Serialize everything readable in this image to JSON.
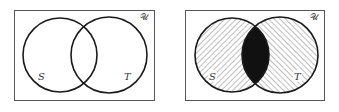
{
  "diagrams": [
    {
      "name": "unshaded",
      "universal_label": "𝒰",
      "set_a_label": "S",
      "set_b_label": "T",
      "shading": "none"
    },
    {
      "name": "shaded",
      "universal_label": "𝒰",
      "set_a_label": "S",
      "set_b_label": "T",
      "shading": "S and T hatched (S: \\ direction, T: / direction), intersection S∩T solid black"
    }
  ],
  "colors": {
    "border": "#555555",
    "circle_stroke": "#1a1a1a",
    "hatch": "#8a8a8a",
    "intersection_fill": "#111111",
    "background": "#ffffff"
  }
}
